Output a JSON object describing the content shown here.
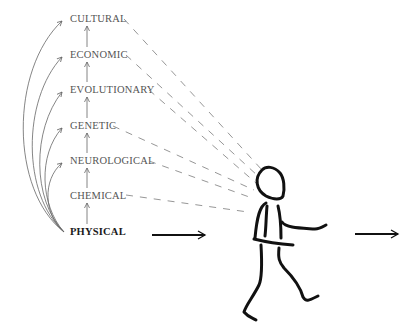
{
  "diagram": {
    "type": "hierarchy-of-causation",
    "levels": [
      {
        "label": "CULTURAL",
        "y": 19,
        "x_end": 121
      },
      {
        "label": "ECONOMIC",
        "y": 55,
        "x_end": 123
      },
      {
        "label": "EVOLUTIONARY",
        "y": 90,
        "x_end": 146
      },
      {
        "label": "GENETIC",
        "y": 126,
        "x_end": 110
      },
      {
        "label": "NEUROLOGICAL",
        "y": 161,
        "x_end": 146
      },
      {
        "label": "CHEMICAL",
        "y": 196,
        "x_end": 122
      },
      {
        "label": "PHYSICAL",
        "y": 232,
        "x_end": 120,
        "bold": true
      }
    ],
    "arrows": {
      "input_arrow": {
        "x1": 152,
        "x2": 205,
        "y": 235
      },
      "output_arrow": {
        "x1": 355,
        "x2": 398,
        "y": 234
      }
    },
    "figure": "walking-stick-person",
    "colors": {
      "label": "#555555",
      "bold_label": "#1a1a1a",
      "dash": "#888888",
      "stroke": "#111111",
      "curve": "#666666"
    }
  }
}
